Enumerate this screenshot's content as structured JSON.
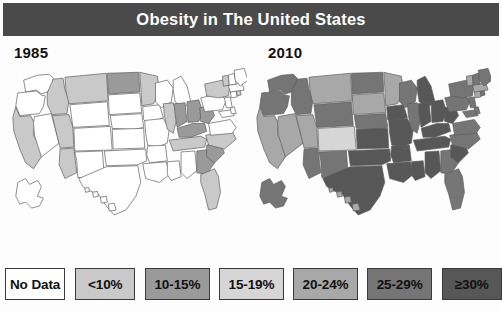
{
  "title": "Obesity in The United States",
  "panels": [
    {
      "year": "1985",
      "name": "map-1985"
    },
    {
      "year": "2010",
      "name": "map-2010"
    }
  ],
  "legend": {
    "items": [
      {
        "label": "No Data",
        "color": "#ffffff",
        "width": 62
      },
      {
        "label": "<10%",
        "color": "#c9c9c9",
        "width": 62
      },
      {
        "label": "10-15%",
        "color": "#9a9a9a",
        "width": 66
      },
      {
        "label": "15-19%",
        "color": "#d6d6d6",
        "width": 66
      },
      {
        "label": "20-24%",
        "color": "#a8a8a8",
        "width": 66
      },
      {
        "label": "25-29%",
        "color": "#757575",
        "width": 66
      },
      {
        "label": "≥30%",
        "color": "#575757",
        "width": 62
      }
    ]
  },
  "chart_data": {
    "type": "map",
    "title": "Obesity in The United States",
    "subtitle": "",
    "xlabel": "",
    "ylabel": "",
    "legend_position": "bottom",
    "grid": false,
    "categories": [
      "No Data",
      "<10%",
      "10-15%",
      "15-19%",
      "20-24%",
      "25-29%",
      "≥30%"
    ],
    "category_colors": [
      "#ffffff",
      "#c9c9c9",
      "#9a9a9a",
      "#d6d6d6",
      "#a8a8a8",
      "#757575",
      "#575757"
    ],
    "series": [
      {
        "name": "1985",
        "values": {
          "WA": "No Data",
          "OR": "No Data",
          "CA": "<10%",
          "NV": "No Data",
          "ID": "<10%",
          "MT": "<10%",
          "WY": "No Data",
          "UT": "<10%",
          "AZ": "<10%",
          "CO": "No Data",
          "NM": "No Data",
          "ND": "10-15%",
          "SD": "No Data",
          "NE": "No Data",
          "KS": "No Data",
          "OK": "No Data",
          "TX": "No Data",
          "MN": "<10%",
          "IA": "No Data",
          "MO": "No Data",
          "AR": "No Data",
          "LA": "No Data",
          "WI": "No Data",
          "IL": "<10%",
          "MS": "No Data",
          "MI": "No Data",
          "IN": "10-15%",
          "KY": "10-15%",
          "TN": "<10%",
          "AL": "No Data",
          "OH": "10-15%",
          "WV": "10-15%",
          "GA": "10-15%",
          "FL": "<10%",
          "SC": "10-15%",
          "NC": "<10%",
          "VA": "No Data",
          "PA": "No Data",
          "NY": "<10%",
          "MD": "No Data",
          "DE": "No Data",
          "NJ": "No Data",
          "CT": "No Data",
          "RI": "<10%",
          "MA": "No Data",
          "VT": "<10%",
          "NH": "No Data",
          "ME": "No Data",
          "AK": "No Data",
          "HI": "No Data"
        }
      },
      {
        "name": "2010",
        "values": {
          "WA": "25-29%",
          "OR": "25-29%",
          "CA": "20-24%",
          "NV": "20-24%",
          "ID": "25-29%",
          "MT": "20-24%",
          "WY": "25-29%",
          "UT": "20-24%",
          "AZ": "25-29%",
          "CO": "15-19%",
          "NM": "25-29%",
          "ND": "25-29%",
          "SD": "20-24%",
          "NE": "25-29%",
          "KS": "≥30%",
          "OK": "≥30%",
          "TX": "≥30%",
          "MN": "20-24%",
          "IA": "≥30%",
          "MO": "≥30%",
          "AR": "≥30%",
          "LA": "≥30%",
          "WI": "25-29%",
          "IL": "25-29%",
          "MS": "≥30%",
          "MI": "≥30%",
          "IN": "≥30%",
          "KY": "≥30%",
          "TN": "≥30%",
          "AL": "≥30%",
          "OH": "≥30%",
          "WV": "≥30%",
          "GA": "25-29%",
          "FL": "25-29%",
          "SC": "≥30%",
          "NC": "25-29%",
          "VA": "25-29%",
          "PA": "25-29%",
          "NY": "25-29%",
          "MD": "25-29%",
          "DE": "25-29%",
          "NJ": "25-29%",
          "CT": "20-24%",
          "RI": "25-29%",
          "MA": "20-24%",
          "VT": "20-24%",
          "NH": "25-29%",
          "ME": "25-29%",
          "AK": "25-29%",
          "HI": "20-24%"
        }
      }
    ]
  },
  "geometry": {
    "viewbox": "0 0 247 172",
    "states": {
      "WA": "M20,14 L34,9 L46,8 L50,12 L49,20 L44,26 L38,28 L33,24 L22,26 Z",
      "OR": "M14,27 L33,25 L38,29 L42,30 L40,41 L36,48 L16,50 L12,40 Z",
      "CA": "M12,41 L16,51 L27,50 L31,58 L30,70 L37,82 L38,92 L30,104 L22,98 L16,84 L10,66 L9,52 Z",
      "NV": "M31,51 L48,48 L56,78 L38,92 L31,70 L30,58 Z",
      "ID": "M44,27 L50,13 L60,12 L62,24 L66,34 L64,48 L49,49 L44,39 Z",
      "MT": "M62,11 L104,7 L106,35 L66,38 L63,25 Z",
      "WY": "M67,39 L105,36 L107,60 L70,62 Z",
      "UT": "M50,50 L66,49 L70,62 L71,82 L57,83 L49,50 Z",
      "CO": "M71,63 L108,61 L110,85 L72,86 Z",
      "AZ": "M57,84 L71,83 L74,108 L62,114 L56,100 Z",
      "NM": "M72,87 L100,86 L102,112 L75,113 L74,96 Z",
      "ND": "M105,7 L137,6 L138,26 L106,28 Z",
      "SD": "M106,29 L138,27 L140,47 L107,49 Z",
      "NE": "M108,50 L140,48 L142,62 L132,64 L110,63 Z",
      "KS": "M110,64 L142,63 L143,83 L111,84 Z",
      "OK": "M102,86 L144,84 L145,96 L136,100 L104,101 Z",
      "TX": "M76,114 L104,102 L136,101 L139,118 L134,132 L124,146 L112,151 L104,142 L96,130 L86,126 L80,122 Z",
      "MN": "M138,6 L156,10 L158,26 L152,38 L140,40 L139,20 Z",
      "IA": "M141,41 L158,39 L162,52 L146,58 L142,54 Z",
      "MO": "M143,55 L162,53 L168,64 L166,78 L156,82 L146,80 L144,68 Z",
      "AR": "M146,81 L164,80 L166,96 L148,98 L145,90 Z",
      "LA": "M141,99 L165,97 L168,110 L158,118 L144,114 Z",
      "WI": "M154,17 L166,14 L172,22 L170,36 L160,42 L154,36 Z",
      "IL": "M162,38 L172,37 L176,52 L172,68 L166,64 L163,50 Z",
      "MS": "M166,97 L178,96 L180,112 L170,116 L166,110 Z",
      "MI": "M172,14 L180,10 L186,20 L190,36 L182,42 L174,36 L172,24 Z",
      "IN": "M173,38 L184,37 L186,56 L176,62 L174,50 Z",
      "KY": "M176,63 L192,58 L204,58 L206,66 L190,72 L178,72 Z",
      "TN": "M168,75 L200,71 L206,74 L204,82 L172,86 Z",
      "AL": "M180,87 L194,86 L196,106 L186,114 L180,108 Z",
      "OH": "M186,36 L198,34 L202,46 L198,56 L187,57 Z",
      "WV": "M199,42 L210,40 L214,50 L208,58 L200,56 Z",
      "GA": "M196,86 L212,84 L214,98 L206,110 L196,108 Z",
      "FL": "M200,110 L214,104 L218,112 L220,128 L216,144 L208,146 L204,130 L200,118 Z",
      "SC": "M206,80 L220,78 L224,88 L214,98 L206,92 Z",
      "NC": "M205,70 L232,66 L236,74 L224,84 L208,80 Z",
      "VA": "M208,58 L230,54 L236,62 L232,68 L210,70 Z",
      "PA": "M200,32 L218,28 L226,34 L222,44 L204,46 Z",
      "NY": "M204,18 L222,14 L230,18 L228,30 L218,32 L206,30 Z",
      "MD": "M218,46 L232,44 L234,50 L222,52 Z",
      "DE": "M230,42 L234,41 L236,48 L231,48 Z",
      "NJ": "M224,32 L230,31 L232,42 L226,42 Z",
      "CT": "M230,26 L236,25 L237,31 L231,32 Z",
      "RI": "M236,25 L240,24 L241,29 L237,30 Z",
      "MA": "M228,19 L242,17 L244,24 L230,26 Z",
      "VT": "M222,10 L228,9 L229,19 L223,20 Z",
      "NH": "M228,9 L234,7 L236,18 L229,19 Z",
      "ME": "M234,4 L244,2 L248,14 L240,20 L235,14 Z",
      "AK": "M14,118 L22,114 L26,120 L34,116 L38,122 L34,132 L40,134 L36,142 L28,144 L22,138 L16,140 L12,132 Z",
      "HI": "M82,124 L86,123 L87,127 L83,128 Z M90,128 L95,127 L96,132 L91,133 Z M98,133 L104,132 L105,138 L99,139 Z M106,140 L112,139 L114,146 L107,147 Z"
    }
  }
}
